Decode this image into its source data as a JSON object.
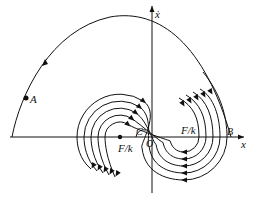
{
  "diagram": {
    "type": "phase-plane",
    "colors": {
      "stroke": "#111111",
      "background": "#ffffff"
    },
    "axes": {
      "x_label": "x",
      "y_label": "ẋ",
      "origin_label": "O"
    },
    "points": {
      "A": {
        "label": "A"
      },
      "B": {
        "label": "B"
      },
      "C": {
        "label": "C"
      },
      "left_center": {
        "label": "F/k"
      },
      "right_center": {
        "label": "F/k"
      }
    },
    "trajectory_count": 5
  }
}
